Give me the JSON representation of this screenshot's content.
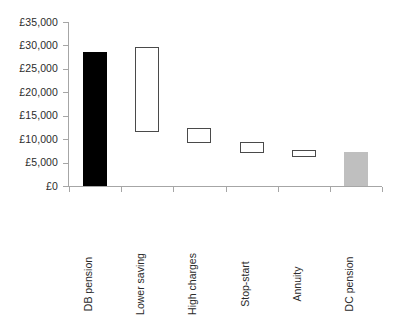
{
  "chart_data": {
    "type": "bar",
    "title": "",
    "subtitle": "",
    "xlabel": "",
    "ylabel": "",
    "categories": [
      "DB pension",
      "Lower saving",
      "High charges",
      "Stop-start",
      "Annuity",
      "DC pension"
    ],
    "series": [
      {
        "name": "Pension outcome range",
        "bars": [
          {
            "category": "DB pension",
            "low": 0,
            "high": 28600,
            "style": "filled-black",
            "fill": "#000000",
            "border": "#000000"
          },
          {
            "category": "Lower saving",
            "low": 11500,
            "high": 29700,
            "style": "hollow",
            "fill": "#ffffff",
            "border": "#4a4a4a"
          },
          {
            "category": "High charges",
            "low": 9200,
            "high": 12400,
            "style": "hollow",
            "fill": "#ffffff",
            "border": "#4a4a4a"
          },
          {
            "category": "Stop-start",
            "low": 7100,
            "high": 9400,
            "style": "hollow",
            "fill": "#ffffff",
            "border": "#4a4a4a"
          },
          {
            "category": "Annuity",
            "low": 6200,
            "high": 7700,
            "style": "hollow",
            "fill": "#ffffff",
            "border": "#4a4a4a"
          },
          {
            "category": "DC pension",
            "low": 0,
            "high": 7300,
            "style": "filled-grey",
            "fill": "#bfbfbf",
            "border": "#bfbfbf"
          }
        ]
      }
    ],
    "ylim": [
      0,
      35000
    ],
    "ytick_values": [
      0,
      5000,
      10000,
      15000,
      20000,
      25000,
      30000,
      35000
    ],
    "ytick_labels": [
      "£0",
      "£5,000",
      "£10,000",
      "£15,000",
      "£20,000",
      "£25,000",
      "£30,000",
      "£35,000"
    ],
    "grid": false,
    "legend": null,
    "legend_position": "none",
    "currency_symbol": "£",
    "axis_color": "#a6a6a6",
    "text_color": "#2b2b2b"
  }
}
